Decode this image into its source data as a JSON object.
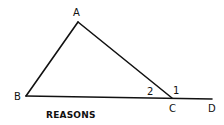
{
  "diagram": {
    "type": "geometry-triangle-exterior-angle",
    "colors": {
      "line": "#111111",
      "background": "#ffffff"
    },
    "points": {
      "A": {
        "label": "A",
        "x": 78,
        "y": 22
      },
      "B": {
        "label": "B",
        "x": 26,
        "y": 96
      },
      "C": {
        "label": "C",
        "x": 172,
        "y": 98
      },
      "D": {
        "label": "D",
        "x": 212,
        "y": 99
      }
    },
    "segments": [
      {
        "from": "A",
        "to": "B"
      },
      {
        "from": "A",
        "to": "C"
      },
      {
        "from": "B",
        "to": "D"
      }
    ],
    "angles": [
      {
        "label": "2",
        "vertex": "C",
        "description": "interior angle ACB"
      },
      {
        "label": "1",
        "vertex": "C",
        "description": "exterior angle ACD"
      }
    ],
    "caption": "REASONS"
  }
}
